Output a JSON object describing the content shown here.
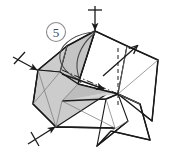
{
  "figure": {
    "kind": "origami-instruction-diagram",
    "step_number": "5",
    "step_badge_shape": "circle",
    "width": 169,
    "height": 156,
    "background_color": "#ffffff"
  },
  "colors": {
    "paper_front": "#ffffff",
    "paper_back_shaded": "#cccccc",
    "paper_back_shaded_dark": "#bdbdbd",
    "outline": "#1a1a1a",
    "thin_crease": "#6e6e6e",
    "badge_stroke": "#8c8c8c",
    "badge_text": "#4a4a4a",
    "arrow": "#1a1a1a"
  },
  "line_styles": {
    "edge": "solid",
    "valley_fold": "dashed",
    "mountain_fold": "dash-dot",
    "hidden_edge": "thin-solid"
  },
  "arrows": [
    {
      "name": "push-down-arrow-top",
      "label": "",
      "direction": "down",
      "has_tail_crossbar": true,
      "from": [
        95,
        5
      ],
      "to": [
        95,
        31
      ]
    },
    {
      "name": "push-in-arrow-left",
      "label": "",
      "direction": "down-right",
      "has_tail_crossbar": true,
      "from": [
        12,
        57
      ],
      "to": [
        38,
        70
      ]
    },
    {
      "name": "push-in-arrow-bottom-left",
      "label": "",
      "direction": "up-right",
      "has_tail_crossbar": true,
      "from": [
        28,
        144
      ],
      "to": [
        56,
        127
      ]
    },
    {
      "name": "unfold-arrow-right",
      "label": "",
      "direction": "up-right",
      "has_tail_crossbar": false,
      "from": [
        107,
        73
      ],
      "to": [
        138,
        46
      ]
    },
    {
      "name": "fold-arrow-center",
      "label": "",
      "direction": "down-right",
      "has_tail_crossbar": false,
      "from": [
        62,
        74
      ],
      "to": [
        106,
        90
      ]
    }
  ],
  "shapes": {
    "shaded_panels": 3,
    "white_panels": 6,
    "curved_hinge_loop": true
  },
  "annotations": {
    "step_badge": "5"
  }
}
